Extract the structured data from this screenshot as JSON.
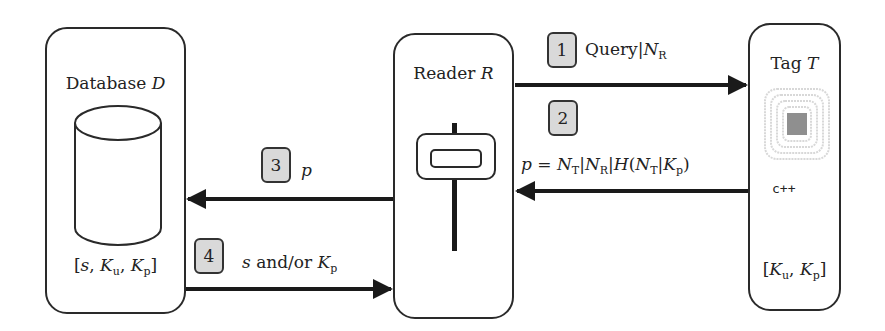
{
  "database": {
    "title_prefix": "Database",
    "title_var": "D",
    "keys": {
      "open": "[",
      "s": "s",
      "sep1": ", ",
      "K1": "K",
      "K1_sub": "u",
      "sep2": ", ",
      "K2": "K",
      "K2_sub": "p",
      "close": "]"
    }
  },
  "reader": {
    "title_prefix": "Reader",
    "title_var": "R"
  },
  "tag": {
    "title_prefix": "Tag",
    "title_var": "T",
    "chip_label": "c++",
    "keys": {
      "open": "[",
      "K1": "K",
      "K1_sub": "u",
      "sep": ", ",
      "K2": "K",
      "K2_sub": "p",
      "close": "]"
    }
  },
  "steps": [
    {
      "num": "1",
      "text_a": "Query|",
      "var": "N",
      "sub": "R"
    },
    {
      "num": "2"
    },
    {
      "num": "3",
      "var": "p"
    },
    {
      "num": "4",
      "s": "s",
      "mid": " and/or ",
      "K": "K",
      "K_sub": "p"
    }
  ],
  "message2": {
    "p": "p",
    "eq": " = ",
    "N": "N",
    "T": "T",
    "bar": "|",
    "R": "R",
    "H": "H",
    "lp": "(",
    "Kp_K": "K",
    "Kp_p": "p",
    "rp": ")"
  },
  "colors": {
    "stroke": "#2a2a2a",
    "step_fill": "#d9d9d9",
    "chip_fill": "#8f8f8f",
    "ring": "#d0d0d0"
  }
}
